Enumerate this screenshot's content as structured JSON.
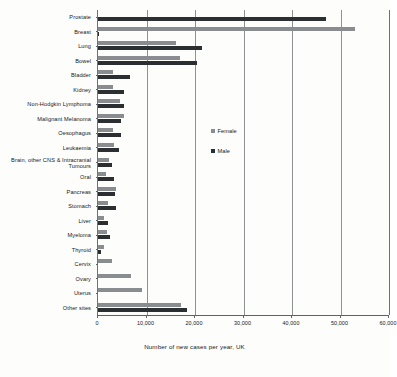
{
  "chart_data": {
    "type": "bar",
    "orientation": "horizontal",
    "title": "",
    "xlabel": "Number of new cases per year, UK",
    "ylabel": "",
    "xlim": [
      0,
      60000
    ],
    "xticks": [
      0,
      10000,
      20000,
      30000,
      40000,
      50000,
      60000
    ],
    "xtick_labels": [
      "0",
      "10,000",
      "20,000",
      "30,000",
      "40,000",
      "50,000",
      "60,000"
    ],
    "grid": true,
    "legend_position": "center-right",
    "categories": [
      "Prostate",
      "Breast",
      "Lung",
      "Bowel",
      "Bladder",
      "Kidney",
      "Non-Hodgkin Lymphoma",
      "Malignant Melanoma",
      "Oesophagus",
      "Leukaemia",
      "Brain, other CNS & Intracranial Tumours",
      "Oral",
      "Pancreas",
      "Stomach",
      "Liver",
      "Myeloma",
      "Thyroid",
      "Cervix",
      "Ovary",
      "Uterus",
      "Other sites"
    ],
    "series": [
      {
        "name": "Female",
        "color": "#8a8d8f",
        "values": [
          0,
          53000,
          16000,
          17000,
          3100,
          3100,
          4600,
          5400,
          3000,
          3400,
          2200,
          1700,
          3700,
          2000,
          1300,
          1900,
          1300,
          2800,
          6900,
          9000,
          17200
        ]
      },
      {
        "name": "Male",
        "color": "#2c2f31",
        "values": [
          47000,
          300,
          21500,
          20500,
          6600,
          5300,
          5300,
          4700,
          4800,
          4300,
          2900,
          3400,
          3600,
          3700,
          2100,
          2400,
          600,
          0,
          0,
          0,
          18300
        ]
      }
    ]
  },
  "legend": {
    "items": [
      {
        "label": "Female",
        "swatch": "female-swatch",
        "color": "#8a8d8f"
      },
      {
        "label": "Male",
        "swatch": "male-swatch",
        "color": "#2c2f31"
      }
    ]
  }
}
